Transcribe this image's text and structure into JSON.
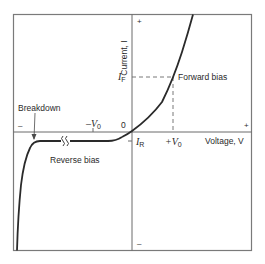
{
  "diagram": {
    "axes": {
      "x_label": "Voltage, V",
      "y_label": "Current, I",
      "x_plus": "+",
      "x_minus": "–",
      "y_plus": "+",
      "y_minus": "–",
      "origin": "0"
    },
    "ticks": {
      "neg_v0": "–V",
      "neg_v0_sub": "0",
      "pos_v0": "+V",
      "pos_v0_sub": "0",
      "i_f": "I",
      "i_f_sub": "F",
      "i_r": "I",
      "i_r_sub": "R"
    },
    "regions": {
      "forward": "Forward bias",
      "reverse": "Reverse bias",
      "breakdown": "Breakdown"
    },
    "colors": {
      "curve": "#2a2a2a",
      "frame": "#7a7a7a",
      "axis": "#6a6a6a",
      "dashed": "#6a6a6a"
    }
  }
}
